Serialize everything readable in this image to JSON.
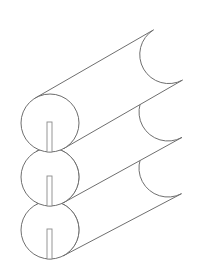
{
  "document": {
    "title": "Slotted Cylinders Technical Drawing",
    "subject": "three-stacked-slotted-tubes",
    "view": "isometric",
    "background_color": "#ffffff",
    "line_color": "#6f6f6f",
    "slot_line_color": "#8a8a8a",
    "line_width": 1,
    "canvas": {
      "width": 201,
      "height": 273
    }
  },
  "geometry": {
    "axis_direction": {
      "dx": 148,
      "dy": -86,
      "description": "cylinder axis points up and to the right"
    },
    "end_face": {
      "shape": "circle",
      "radius_x": 29,
      "radius_y": 29
    },
    "cylinders": [
      {
        "id": "cylinder-top",
        "label": "Top cylinder",
        "near_face_center": {
          "x": 50,
          "y": 123
        },
        "far_face_center": {
          "x": 168,
          "y": 55
        },
        "slot": {
          "x": 47,
          "y": 122,
          "width": 5,
          "height": 30,
          "orientation": "vertical",
          "position": "bottom-center of end face"
        }
      },
      {
        "id": "cylinder-middle",
        "label": "Middle cylinder",
        "near_face_center": {
          "x": 50,
          "y": 177
        },
        "far_face_center": {
          "x": 168,
          "y": 112
        },
        "slot": {
          "x": 47,
          "y": 176,
          "width": 5,
          "height": 30,
          "orientation": "vertical",
          "position": "bottom-center of end face"
        }
      },
      {
        "id": "cylinder-bottom",
        "label": "Bottom cylinder",
        "near_face_center": {
          "x": 50,
          "y": 230
        },
        "far_face_center": {
          "x": 168,
          "y": 168
        },
        "slot": {
          "x": 47,
          "y": 229,
          "width": 5,
          "height": 30,
          "orientation": "vertical",
          "position": "bottom-center of end face"
        }
      }
    ]
  }
}
